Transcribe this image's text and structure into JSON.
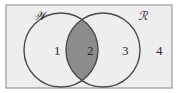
{
  "diagram": {
    "type": "venn",
    "sets": [
      {
        "name": "W",
        "label": "𝒲"
      },
      {
        "name": "R",
        "label": "ℛ"
      }
    ],
    "regions": [
      {
        "id": 1,
        "label": "1",
        "description": "W only",
        "shaded": false
      },
      {
        "id": 2,
        "label": "2",
        "description": "W and R",
        "shaded": true
      },
      {
        "id": 3,
        "label": "3",
        "description": "R only",
        "shaded": false
      },
      {
        "id": 4,
        "label": "4",
        "description": "neither",
        "shaded": false
      }
    ],
    "colors": {
      "background": "#eeeeee",
      "border": "#9a9a9a",
      "circle": "#4a4a4a",
      "shade": "#8c8c8c"
    }
  }
}
